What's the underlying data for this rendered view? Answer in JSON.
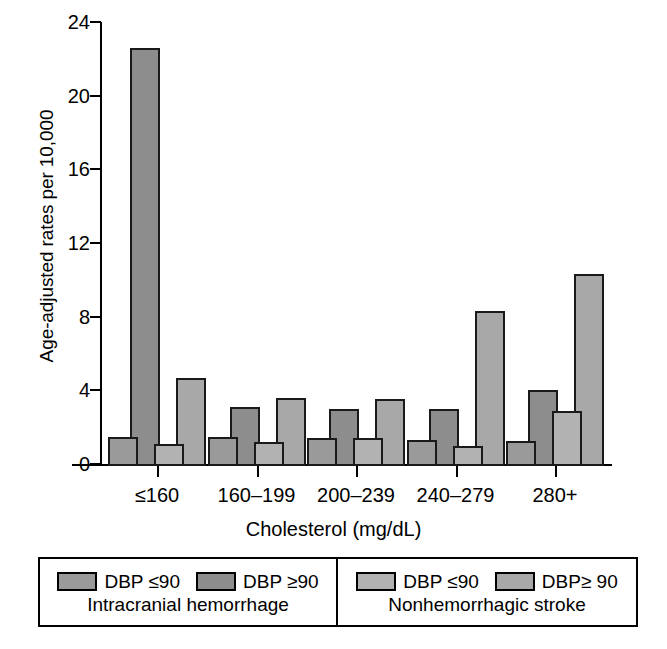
{
  "chart_data": {
    "type": "bar",
    "title": "",
    "subtitle": "",
    "xlabel": "Cholesterol (mg/dL)",
    "ylabel": "Age-adjusted rates per 10,000",
    "categories": [
      "≤160",
      "160–199",
      "200–239",
      "240–279",
      "280+"
    ],
    "ylim": [
      0,
      24
    ],
    "yticks": [
      0,
      4,
      8,
      12,
      16,
      20,
      24
    ],
    "ytick_labels": [
      "0",
      "4",
      "8",
      "12",
      "16",
      "20",
      "24"
    ],
    "grid": false,
    "legend_position": "below-axes",
    "series": [
      {
        "name": "Intracranial hemorrhage — DBP ≤90",
        "group": "Intracranial hemorrhage",
        "level": "DBP ≤90",
        "color": "#9a9a9a",
        "values": [
          1.6,
          1.6,
          1.5,
          1.4,
          1.35
        ]
      },
      {
        "name": "Intracranial hemorrhage — DBP ≥90",
        "group": "Intracranial hemorrhage",
        "level": "DBP ≥90",
        "color": "#8d8d8d",
        "values": [
          22.7,
          3.2,
          3.1,
          3.1,
          4.15
        ]
      },
      {
        "name": "Nonhemorrhagic stroke — DBP ≤90",
        "group": "Nonhemorrhagic stroke",
        "level": "DBP ≤90",
        "color": "#b2b2b2",
        "values": [
          1.2,
          1.3,
          1.5,
          1.1,
          3.0
        ]
      },
      {
        "name": "Nonhemorrhagic stroke — DBP≥ 90",
        "group": "Nonhemorrhagic stroke",
        "level": "DBP≥ 90",
        "color": "#a8a8a8",
        "values": [
          4.8,
          3.7,
          3.65,
          8.4,
          10.4
        ]
      }
    ]
  },
  "axes": {
    "ylabel": "Age-adjusted rates per 10,000",
    "xlabel": "Cholesterol (mg/dL)",
    "ytick_labels": [
      "24",
      "20",
      "16",
      "12",
      "8",
      "4",
      "0"
    ],
    "xtick_labels": [
      "≤160",
      "160–199",
      "200–239",
      "240–279",
      "280+"
    ]
  },
  "legend": {
    "panels": [
      {
        "title": "Intracranial hemorrhage",
        "keys": [
          {
            "label": "DBP ≤90",
            "color": "#9a9a9a"
          },
          {
            "label": "DBP ≥90",
            "color": "#8d8d8d"
          }
        ]
      },
      {
        "title": "Nonhemorrhagic stroke",
        "keys": [
          {
            "label": "DBP ≤90",
            "color": "#b2b2b2"
          },
          {
            "label": "DBP≥ 90",
            "color": "#a8a8a8"
          }
        ]
      }
    ]
  }
}
